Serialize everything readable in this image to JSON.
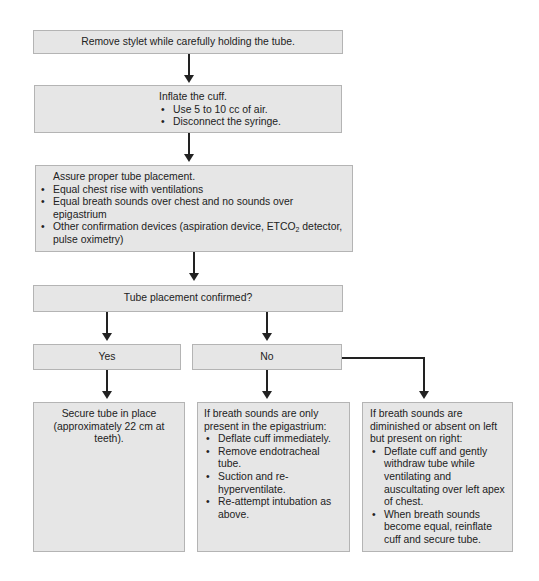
{
  "flowchart": {
    "step1": {
      "text": "Remove stylet while carefully holding the tube."
    },
    "step2": {
      "title": "Inflate the cuff.",
      "bullets": [
        "Use 5 to 10 cc of air.",
        "Disconnect the syringe."
      ]
    },
    "step3": {
      "title": "Assure proper tube placement.",
      "bullets": [
        "Equal chest rise with ventilations",
        "Equal breath sounds over chest and no sounds over epigastrium",
        "Other confirmation devices (aspiration device, ETCO",
        "2",
        " detector, pulse oximetry)"
      ]
    },
    "decision": {
      "text": "Tube placement confirmed?"
    },
    "yes": {
      "label": "Yes",
      "outcome": "Secure tube in place (approximately 22 cm at teeth)."
    },
    "no": {
      "label": "No",
      "epigastrium": {
        "title": "If breath sounds are only present in the epigastrium:",
        "bullets": [
          "Deflate cuff immediately.",
          "Remove endotracheal tube.",
          "Suction and re-hyperventilate.",
          "Re-attempt intubation as above."
        ]
      },
      "right_only": {
        "title": "If breath sounds are diminished or absent on left but present on right:",
        "bullets": [
          "Deflate cuff and gently withdraw tube while ventilating and auscultating over left apex of chest.",
          "When breath sounds become equal, reinflate cuff and secure tube."
        ]
      }
    }
  },
  "colors": {
    "box_fill": "#e6e6e6",
    "box_border": "#b4b4b4",
    "connector": "#222222"
  }
}
